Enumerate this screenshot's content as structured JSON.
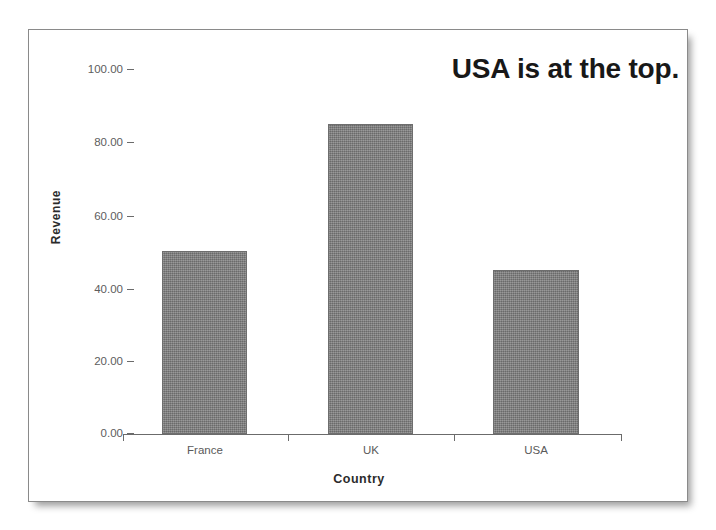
{
  "chart_data": {
    "type": "bar",
    "title": "",
    "annotation": "USA is at the top.",
    "categories": [
      "France",
      "UK",
      "USA"
    ],
    "values": [
      50,
      85,
      45
    ],
    "series": [
      {
        "name": "Revenue",
        "values": [
          50,
          85,
          45
        ]
      }
    ],
    "xlabel": "Country",
    "ylabel": "Revenue",
    "ylim": [
      0,
      100
    ],
    "ytick_labels": [
      "0.00",
      "20.00",
      "40.00",
      "60.00",
      "80.00",
      "100.00"
    ],
    "ytick_values": [
      0,
      20,
      40,
      60,
      80,
      100
    ],
    "grid": false,
    "legend": false,
    "bar_color": "#7f7f7f",
    "bar_edge_color": "#6e6e6e",
    "axis_color": "#6b6b6b",
    "tick_label_color": "#5a5a5a",
    "axis_title_color": "#2b2b2b",
    "annotation_color": "#181818",
    "frame_border_color": "#8a8a8a",
    "background_color": "#ffffff"
  },
  "chart": {
    "annotation": "USA is at the top.",
    "x_axis_title": "Country",
    "y_axis_title": "Revenue",
    "y_ticks": [
      {
        "label": "100.00",
        "value": 100
      },
      {
        "label": "80.00",
        "value": 80
      },
      {
        "label": "60.00",
        "value": 60
      },
      {
        "label": "40.00",
        "value": 40
      },
      {
        "label": "20.00",
        "value": 20
      },
      {
        "label": "0.00",
        "value": 0
      }
    ],
    "bars": [
      {
        "category": "France",
        "value": 50
      },
      {
        "category": "UK",
        "value": 85
      },
      {
        "category": "USA",
        "value": 45
      }
    ]
  }
}
